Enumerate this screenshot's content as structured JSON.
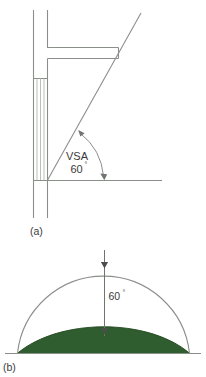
{
  "figure": {
    "background_color": "#ffffff",
    "line_color": "#8a8f8a",
    "text_color": "#3a3a3a",
    "ground_color": "#2f5d2f",
    "panels": [
      {
        "tag": "(a)",
        "description": "section through building showing vertical sky angle measured from a window sill up to the sight line past the overhang",
        "angle_label": "VSA",
        "angle_value": "60",
        "degree_symbol": "°"
      },
      {
        "tag": "(b)",
        "description": "sky dome hemisphere with shaded terrain profile and vertical dimension of the sky angle",
        "angle_value": "60",
        "degree_symbol": "°"
      }
    ]
  },
  "panel_a": {
    "tag": "(a)",
    "angle_name": "VSA",
    "angle_number": "60",
    "degree_symbol": "°"
  },
  "panel_b": {
    "tag": "(b)",
    "angle_number": "60",
    "degree_symbol": "°"
  }
}
